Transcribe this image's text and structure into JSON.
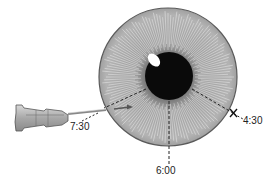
{
  "diagram": {
    "colors": {
      "iris_fill": "#a9a9a9",
      "iris_outline": "#5a5a5a",
      "iris_inner": "#7a7a7a",
      "pupil": "#0a0a0a",
      "highlight": "#ffffff",
      "needle_hub": "#b8b8b8",
      "dash": "#222222"
    },
    "labels": {
      "pos_730": "7:30",
      "pos_600": "6:00",
      "pos_430": "4:30"
    },
    "markers": {
      "exit_mark": "x-mark at 4:30"
    }
  }
}
